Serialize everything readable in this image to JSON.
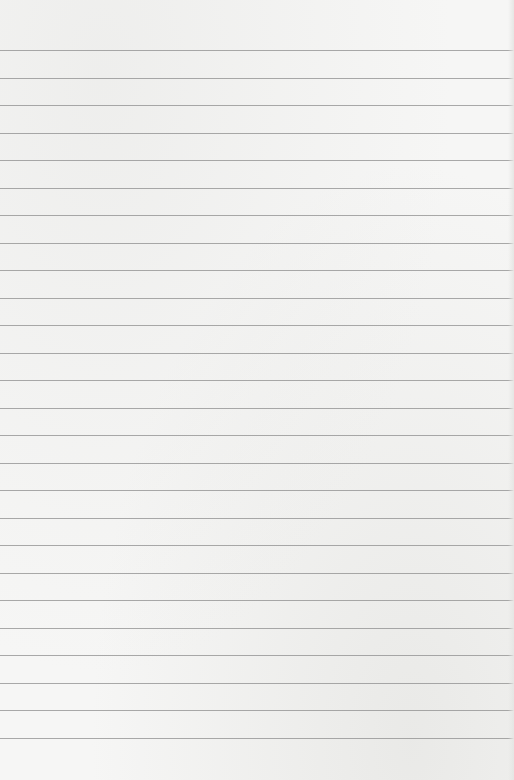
{
  "image": {
    "description": "Blank sheet of lined notebook paper",
    "paper_color": "#f6f6f5",
    "line_color": "#8e8e8e",
    "line_count": 26,
    "first_line_y": 50,
    "line_spacing": 27.5
  }
}
